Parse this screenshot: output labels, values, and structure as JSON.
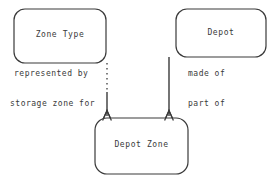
{
  "diagram": {
    "type": "entity-relationship-diagram",
    "background_color": "#ffffff",
    "stroke_color": "#3a3a3a",
    "text_color": "#3a3a3a",
    "entities": [
      {
        "id": "zone-type",
        "label": "Zone Type"
      },
      {
        "id": "depot",
        "label": "Depot"
      },
      {
        "id": "depot-zone",
        "label": "Depot Zone"
      }
    ],
    "relationships": [
      {
        "id": "represented-by",
        "label": "represented by",
        "from": "depot-zone",
        "to": "zone-type",
        "line_style": "dotted"
      },
      {
        "id": "storage-zone-for",
        "label": "storage zone for",
        "from": "zone-type",
        "to": "depot-zone",
        "line_style": "solid"
      },
      {
        "id": "made-of",
        "label": "made of",
        "from": "depot",
        "to": "depot-zone",
        "line_style": "solid"
      },
      {
        "id": "part-of",
        "label": "part of",
        "from": "depot-zone",
        "to": "depot",
        "line_style": "solid"
      }
    ]
  }
}
